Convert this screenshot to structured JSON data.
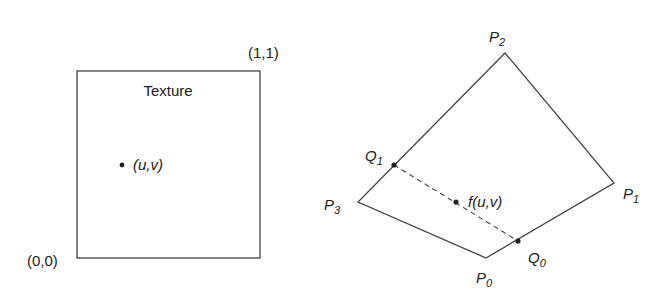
{
  "texture": {
    "title": "Texture",
    "corner_origin": "(0,0)",
    "corner_max": "(1,1)",
    "point_label": "(u,v)"
  },
  "quad": {
    "vertices": [
      {
        "name": "P",
        "sub": "0"
      },
      {
        "name": "P",
        "sub": "1"
      },
      {
        "name": "P",
        "sub": "2"
      },
      {
        "name": "P",
        "sub": "3"
      }
    ],
    "q_points": [
      {
        "name": "Q",
        "sub": "0"
      },
      {
        "name": "Q",
        "sub": "1"
      }
    ],
    "mapped_point_label": "f(u,v)"
  },
  "colors": {
    "stroke": "#444444",
    "text": "#222222",
    "background": "#ffffff"
  }
}
